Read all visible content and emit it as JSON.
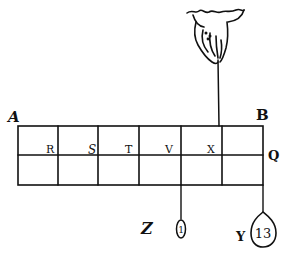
{
  "figure": {
    "type": "lever-balance-diagram",
    "ink_color": "#111111",
    "background": "#ffffff",
    "beam": {
      "corner_labels": {
        "top_left": "A",
        "top_right": "B",
        "right_side": "Q"
      },
      "division_labels": [
        "R",
        "S",
        "T",
        "V",
        "X"
      ],
      "columns": 6,
      "rows": 2
    },
    "suspension": {
      "icon": "hand-icon",
      "attach_point_label": "X"
    },
    "weights": [
      {
        "label": "Z",
        "value": "1",
        "hangs_from": "V",
        "shape": "oval"
      },
      {
        "label": "Y",
        "value": "13",
        "hangs_from": "Q",
        "shape": "teardrop"
      }
    ]
  }
}
